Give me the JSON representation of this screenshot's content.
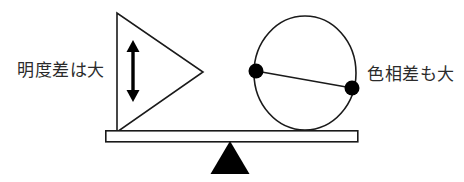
{
  "diagram": {
    "type": "balance-scale",
    "title_visible": false,
    "background_color": "#ffffff",
    "stroke_color": "#1a1a1a",
    "fill_color": "#000000",
    "labels": {
      "left": "明度差は大",
      "right": "色相差も大"
    },
    "left_pan_shape": {
      "name": "triangle-right-pointing",
      "description": "outlined right-pointing triangle",
      "vertices": "117,13 117,132 203,72",
      "fill": "none",
      "stroke": "#1a1a1a"
    },
    "left_arrow": {
      "name": "double-headed-vertical-arrow",
      "x": 133,
      "y_top": 41,
      "y_bottom": 101,
      "fill": "#000000"
    },
    "right_pan_shape": {
      "name": "circle-with-chord",
      "center_x": 305,
      "center_y": 73,
      "radius_x": 51,
      "radius_y": 57,
      "fill": "none",
      "stroke": "#1a1a1a"
    },
    "right_dots": [
      {
        "name": "dot-left",
        "cx": 256,
        "cy": 71,
        "r": 7,
        "fill": "#000000"
      },
      {
        "name": "dot-right",
        "cx": 352,
        "cy": 88,
        "r": 7,
        "fill": "#000000"
      }
    ],
    "chord_line": {
      "name": "chord",
      "x1": 256,
      "y1": 71,
      "x2": 352,
      "y2": 88,
      "stroke": "#1a1a1a"
    },
    "beam": {
      "name": "balance-beam",
      "x": 105,
      "y": 130,
      "width": 253,
      "height": 12,
      "fill": "#ffffff",
      "stroke": "#1a1a1a"
    },
    "fulcrum": {
      "name": "fulcrum-triangle",
      "vertices": "230,141 249,174 211,174",
      "fill": "#000000"
    }
  }
}
